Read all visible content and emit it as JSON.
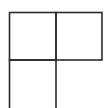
{
  "diagram": {
    "type": "grid-of-squares",
    "stroke_color": "#2b2b2b",
    "background": "#ffffff",
    "cells": [
      {
        "name": "top-left",
        "x": 9,
        "y": 12,
        "w": 47,
        "h": 48
      },
      {
        "name": "top-right",
        "x": 56,
        "y": 12,
        "w": 46,
        "h": 48
      },
      {
        "name": "bottom-left",
        "x": 9,
        "y": 60,
        "w": 47,
        "h": 50
      }
    ]
  }
}
